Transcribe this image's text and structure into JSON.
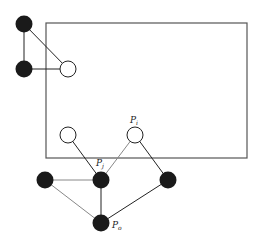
{
  "diagram": {
    "region": {
      "x": 46,
      "y": 23,
      "width": 201,
      "height": 135,
      "stroke": "#555555"
    },
    "nodes": [
      {
        "id": "a",
        "x": 24,
        "y": 24,
        "fill": "black"
      },
      {
        "id": "b",
        "x": 24,
        "y": 69,
        "fill": "black"
      },
      {
        "id": "c",
        "x": 68,
        "y": 69,
        "fill": "white"
      },
      {
        "id": "d",
        "x": 68,
        "y": 135,
        "fill": "white"
      },
      {
        "id": "pi",
        "x": 135,
        "y": 135,
        "fill": "white",
        "label": "P",
        "sub": "i"
      },
      {
        "id": "l",
        "x": 45,
        "y": 180,
        "fill": "black"
      },
      {
        "id": "pj",
        "x": 101,
        "y": 180,
        "fill": "black",
        "label": "P",
        "sub": "j"
      },
      {
        "id": "r",
        "x": 168,
        "y": 180,
        "fill": "black"
      },
      {
        "id": "po",
        "x": 101,
        "y": 223,
        "fill": "black",
        "label": "P",
        "sub": "o"
      }
    ],
    "edges": [
      [
        "a",
        "b"
      ],
      [
        "a",
        "c"
      ],
      [
        "b",
        "c"
      ],
      [
        "d",
        "pj"
      ],
      [
        "pi",
        "pj"
      ],
      [
        "pi",
        "r"
      ],
      [
        "l",
        "pj"
      ],
      [
        "l",
        "po"
      ],
      [
        "pj",
        "po"
      ],
      [
        "r",
        "po"
      ]
    ],
    "labels": {
      "pi": {
        "main": "P",
        "sub": "i"
      },
      "pj": {
        "main": "P",
        "sub": "j"
      },
      "po": {
        "main": "P",
        "sub": "o"
      }
    }
  }
}
